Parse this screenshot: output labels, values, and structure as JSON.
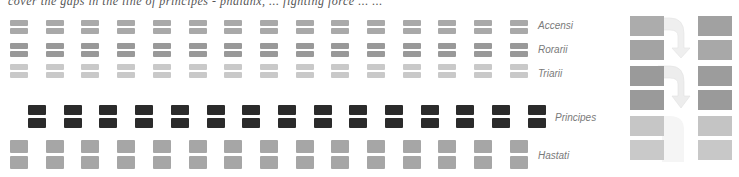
{
  "caption_top": "cover the gaps in the line of principes - phalanx, ...  fighting force ... ...",
  "columns": 15,
  "labels": {
    "accensi": "Accensi",
    "rorarii": "Rorarii",
    "triarii": "Triarii",
    "principes": "Principes",
    "hastati": "Hastati"
  },
  "colors": {
    "accensi": "#a9a9a9",
    "rorarii": "#999999",
    "triarii": "#c9c9c9",
    "principes": "#2b2b2b",
    "hastati": "#a6a6a6",
    "arrow": "#ececec",
    "label": "#7a7a7a"
  },
  "side_diagram": {
    "left_column": [
      "#acacac",
      "#a3a3a3",
      "#9a9a9a",
      "#9a9a9a",
      "#c6c6c6",
      "#c9c9c9"
    ],
    "right_column": [
      "#a1a1a1",
      "#a8a8a8",
      "#9c9c9c",
      "#9a9a9a",
      "#c4c4c4",
      "#c8c8c8"
    ],
    "arrows": [
      "curved-arrow-down",
      "curved-arrow-down"
    ]
  }
}
